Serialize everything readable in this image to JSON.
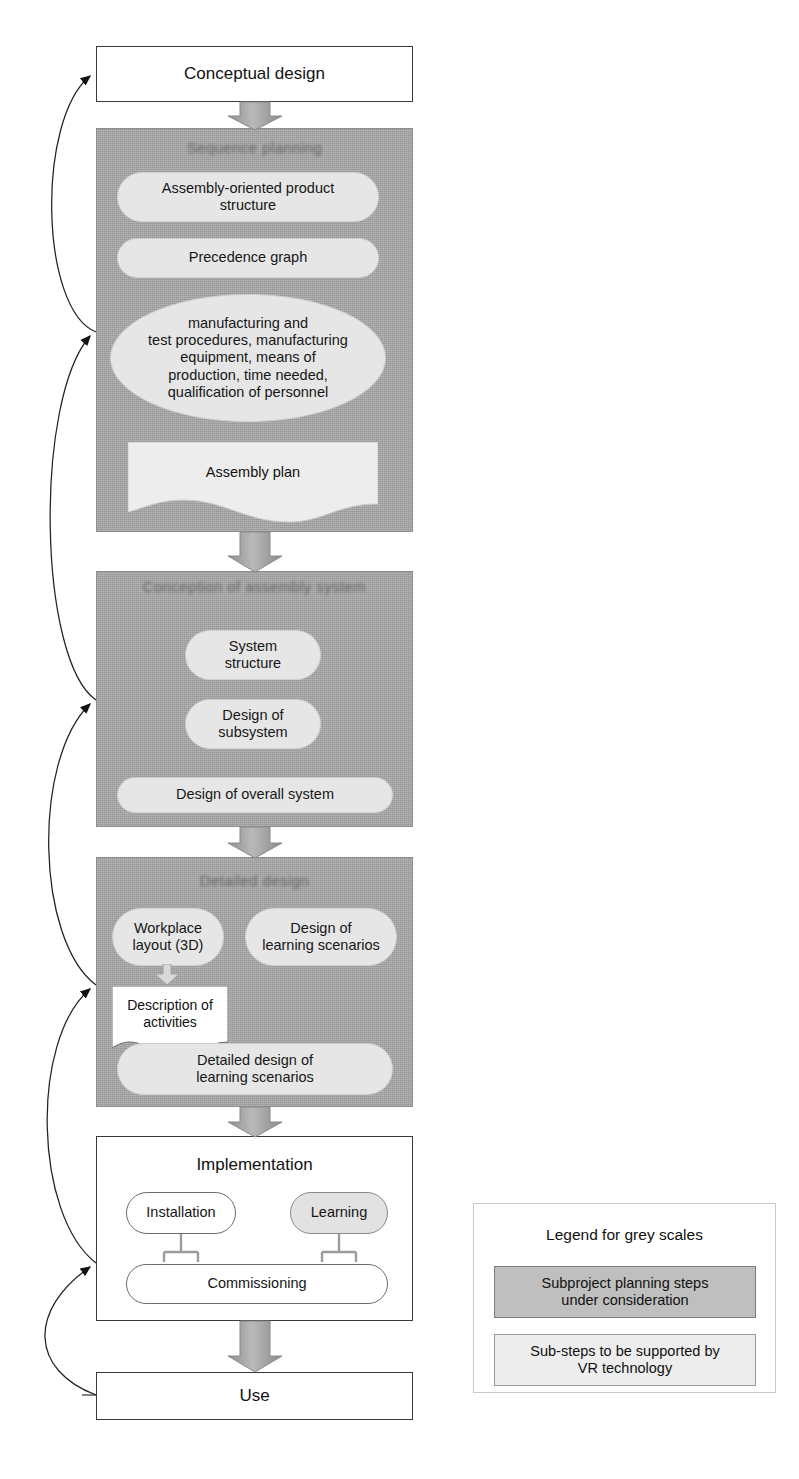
{
  "diagram": {
    "title_top": "Conceptual design",
    "title_bottom": "Use",
    "implementation_label": "Implementation",
    "colors": {
      "stage_grey": "#a8a8a8",
      "substep_grey": "#e6e6e6",
      "legend_dark": "#bfbfbf",
      "legend_light": "#ededed",
      "outline": "#3a3a3a",
      "arrow_fill": "#a9a9a9"
    }
  },
  "nodes": {
    "conceptual_design": "Conceptual design",
    "use": "Use"
  },
  "stages": [
    {
      "id": "stage-1",
      "title": "Sequence planning",
      "title_legible": false,
      "substeps": [
        {
          "id": "assembly-oriented-product-structure",
          "label": "Assembly-oriented product\nstructure",
          "shape": "pill"
        },
        {
          "id": "precedence-graph",
          "label": "Precedence graph",
          "shape": "pill"
        },
        {
          "id": "manufacturing-and-test-procedures",
          "label": "manufacturing and\ntest procedures, manufacturing\nequipment, means of\nproduction, time needed,\nqualification of personnel",
          "shape": "oval"
        },
        {
          "id": "assembly-plan",
          "label": "Assembly plan",
          "shape": "document"
        }
      ]
    },
    {
      "id": "stage-2",
      "title": "Conception of assembly system",
      "title_legible": false,
      "substeps": [
        {
          "id": "system-structure",
          "label": "System\nstructure",
          "shape": "pill"
        },
        {
          "id": "design-of-subsystem",
          "label": "Design of\nsubsystem",
          "shape": "pill"
        },
        {
          "id": "design-of-overall-system",
          "label": "Design of overall system",
          "shape": "pill"
        }
      ]
    },
    {
      "id": "stage-3",
      "title": "Detailed design",
      "title_legible": false,
      "substeps": [
        {
          "id": "workplace-layout-3d",
          "label": "Workplace\nlayout (3D)",
          "shape": "pill"
        },
        {
          "id": "design-of-learning-scenarios",
          "label": "Design of\nlearning scenarios",
          "shape": "pill"
        },
        {
          "id": "description-of-activities",
          "label": "Description\nof activities",
          "shape": "document"
        },
        {
          "id": "detailed-design-of-learning-scenarios",
          "label": "Detailed design of\nlearning scenarios",
          "shape": "pill"
        }
      ]
    }
  ],
  "implementation": {
    "title": "Implementation",
    "items": [
      {
        "id": "installation",
        "label": "Installation",
        "fill": "white"
      },
      {
        "id": "learning",
        "label": "Learning",
        "fill": "grey"
      },
      {
        "id": "commissioning",
        "label": "Commissioning",
        "fill": "white"
      }
    ]
  },
  "legend": {
    "title": "Legend for grey scales",
    "entries": [
      {
        "id": "legend-dark",
        "label": "Subproject planning steps\nunder consideration",
        "swatch": "dark"
      },
      {
        "id": "legend-light",
        "label": "Sub-steps to be supported by\nVR technology",
        "swatch": "light"
      }
    ]
  },
  "flow": {
    "forward_arrows": 5,
    "feedback_arrows": 4
  }
}
